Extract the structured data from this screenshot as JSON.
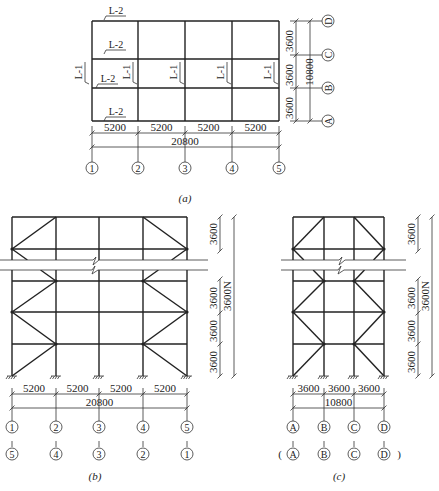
{
  "figure": {
    "plan_a": {
      "caption": "(a)",
      "axes_x": [
        "1",
        "2",
        "3",
        "4",
        "5"
      ],
      "axes_y": [
        "A",
        "B",
        "C",
        "D"
      ],
      "bay_dims_x": [
        "5200",
        "5200",
        "5200",
        "5200"
      ],
      "total_x": "20800",
      "bay_dims_y": [
        "3600",
        "3600",
        "3600"
      ],
      "total_y": "10800",
      "beam_labels": [
        {
          "text": "L-2",
          "x": 116,
          "y": 14,
          "rot": 0
        },
        {
          "text": "L-2",
          "x": 116,
          "y": 48,
          "rot": 0
        },
        {
          "text": "L-2",
          "x": 108,
          "y": 82,
          "rot": 0
        },
        {
          "text": "L-2",
          "x": 116,
          "y": 115,
          "rot": 0
        },
        {
          "text": "L-1",
          "x": 82,
          "y": 72,
          "rot": -90
        },
        {
          "text": "L-1",
          "x": 130,
          "y": 72,
          "rot": -90
        },
        {
          "text": "L-1",
          "x": 177,
          "y": 72,
          "rot": -90
        },
        {
          "text": "L-1",
          "x": 224,
          "y": 72,
          "rot": -90
        },
        {
          "text": "L-1",
          "x": 271,
          "y": 72,
          "rot": -90
        }
      ]
    },
    "elevation_b": {
      "caption": "(b)",
      "axes_top": [
        "1",
        "2",
        "3",
        "4",
        "5"
      ],
      "axes_bottom": [
        "5",
        "4",
        "3",
        "2",
        "1"
      ],
      "bay_dims": [
        "5200",
        "5200",
        "5200",
        "5200"
      ],
      "total": "20800",
      "story_dims": [
        "3600",
        "3600",
        "3600",
        "3600"
      ],
      "total_height": "3600N"
    },
    "elevation_c": {
      "caption": "(c)",
      "axes_top": [
        "A",
        "B",
        "C",
        "D"
      ],
      "axes_bottom": [
        "A",
        "B",
        "C",
        "D"
      ],
      "bottom_paren_open": "(",
      "bottom_paren_close": ")",
      "bay_dims": [
        "3600",
        "3600",
        "3600"
      ],
      "total": "10800",
      "story_dims": [
        "3600",
        "3600",
        "3600",
        "3600"
      ],
      "total_height": "3600N"
    }
  }
}
